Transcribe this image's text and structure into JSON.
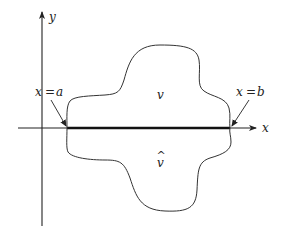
{
  "diagram": {
    "axes": {
      "x_label": "x",
      "y_label": "y"
    },
    "annotations": {
      "left_bound": {
        "var": "x",
        "eq": "=",
        "val": "a"
      },
      "right_bound": {
        "var": "x",
        "eq": "=",
        "val": "b"
      }
    },
    "regions": {
      "upper_label": "v",
      "lower_label": "v",
      "lower_accent": "^"
    },
    "colors": {
      "stroke": "#222222",
      "background": "#ffffff"
    }
  }
}
